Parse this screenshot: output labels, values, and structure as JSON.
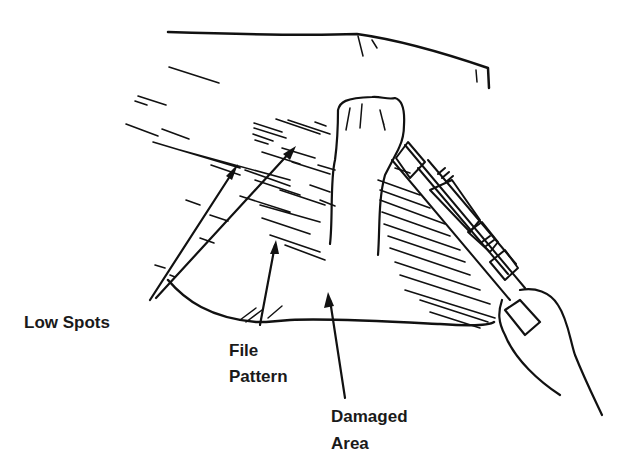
{
  "diagram": {
    "labels": {
      "low_spots": "Low Spots",
      "file_pattern_line1": "File",
      "file_pattern_line2": "Pattern",
      "damaged_area_line1": "Damaged",
      "damaged_area_line2": "Area"
    },
    "colors": {
      "ink": "#111111",
      "background": "#ffffff"
    }
  }
}
